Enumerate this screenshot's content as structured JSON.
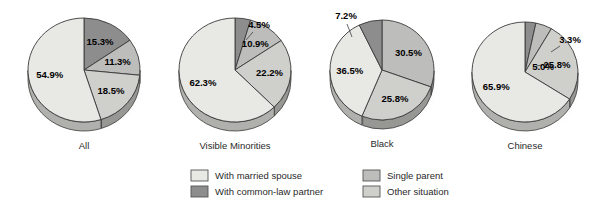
{
  "chart_data": {
    "type": "pie",
    "title": "",
    "subtitle": "",
    "xlabel": "",
    "ylabel": "",
    "legend_position": "bottom",
    "grid": false,
    "categories": [
      "With married spouse",
      "With common-law partner",
      "Single parent",
      "Other situation"
    ],
    "colors": {
      "married_spouse": "#e8e8e4",
      "common_law_partner": "#8d8d8d",
      "single_parent": "#bdbdbb",
      "other_situation": "#cfcfcc",
      "outline": "#3a3a3a",
      "background": "#ffffff"
    },
    "charts": [
      {
        "name": "All",
        "label": "All",
        "slices": [
          {
            "category": "With common-law partner",
            "value": 15.3,
            "label": "15.3%",
            "external": false
          },
          {
            "category": "Single parent",
            "value": 11.3,
            "label": "11.3%",
            "external": false
          },
          {
            "category": "Other situation",
            "value": 18.5,
            "label": "18.5%",
            "external": false
          },
          {
            "category": "With married spouse",
            "value": 54.9,
            "label": "54.9%",
            "external": false
          }
        ]
      },
      {
        "name": "Visible Minorities",
        "label": "Visible Minorities",
        "slices": [
          {
            "category": "With common-law partner",
            "value": 4.5,
            "label": "4.5%",
            "external": true
          },
          {
            "category": "Single parent",
            "value": 10.9,
            "label": "10.9%",
            "external": false
          },
          {
            "category": "Other situation",
            "value": 22.2,
            "label": "22.2%",
            "external": false
          },
          {
            "category": "With married spouse",
            "value": 62.3,
            "label": "62.3%",
            "external": false
          }
        ]
      },
      {
        "name": "Black",
        "label": "Black",
        "slices": [
          {
            "category": "Single parent",
            "value": 30.5,
            "label": "30.5%",
            "external": false
          },
          {
            "category": "Other situation",
            "value": 25.8,
            "label": "25.8%",
            "external": false
          },
          {
            "category": "With married spouse",
            "value": 36.5,
            "label": "36.5%",
            "external": false
          },
          {
            "category": "With common-law partner",
            "value": 7.2,
            "label": "7.2%",
            "external": true
          }
        ]
      },
      {
        "name": "Chinese",
        "label": "Chinese",
        "slices": [
          {
            "category": "With common-law partner",
            "value": 3.3,
            "label": "3.3%",
            "external": true
          },
          {
            "category": "Single parent",
            "value": 5.0,
            "label": "5.0%",
            "external": true
          },
          {
            "category": "Other situation",
            "value": 25.8,
            "label": "25.8%",
            "external": false
          },
          {
            "category": "With married spouse",
            "value": 65.9,
            "label": "65.9%",
            "external": false
          }
        ]
      }
    ]
  },
  "legend": {
    "items": [
      {
        "label": "With married spouse",
        "color": "#e8e8e4"
      },
      {
        "label": "With common-law partner",
        "color": "#8d8d8d"
      },
      {
        "label": "Single parent",
        "color": "#bdbdbb"
      },
      {
        "label": "Other situation",
        "color": "#cfcfcc"
      }
    ]
  }
}
